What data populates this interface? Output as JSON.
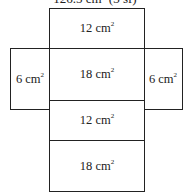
{
  "caption": {
    "text": "126.5 cm² (3 sf)",
    "partially_visible": true
  },
  "net": {
    "unit": "cm",
    "faces": [
      {
        "id": "top",
        "value": "12",
        "unit": "cm",
        "exp": "2"
      },
      {
        "id": "left",
        "value": "6",
        "unit": "cm",
        "exp": "2"
      },
      {
        "id": "center",
        "value": "18",
        "unit": "cm",
        "exp": "2"
      },
      {
        "id": "right",
        "value": "6",
        "unit": "cm",
        "exp": "2"
      },
      {
        "id": "lower",
        "value": "12",
        "unit": "cm",
        "exp": "2"
      },
      {
        "id": "bottom",
        "value": "18",
        "unit": "cm",
        "exp": "2"
      }
    ]
  }
}
